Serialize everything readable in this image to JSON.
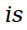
{
  "text": {
    "word": "is"
  },
  "colors": {
    "background": "#ffffff",
    "text": "#000000"
  }
}
